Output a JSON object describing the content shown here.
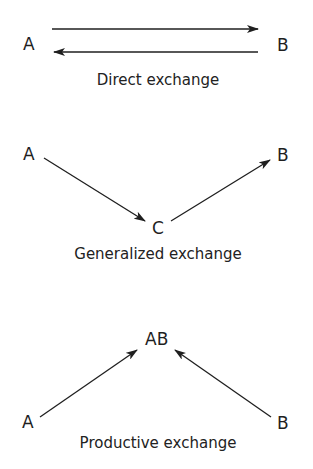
{
  "diagrams": [
    {
      "name": "direct",
      "nodes": {
        "a": "A",
        "b": "B"
      },
      "edges": [
        {
          "from": "A",
          "to": "B"
        },
        {
          "from": "B",
          "to": "A"
        }
      ],
      "caption": "Direct exchange"
    },
    {
      "name": "generalized",
      "nodes": {
        "a": "A",
        "c": "C",
        "b": "B"
      },
      "edges": [
        {
          "from": "A",
          "to": "C"
        },
        {
          "from": "C",
          "to": "B"
        }
      ],
      "caption": "Generalized exchange"
    },
    {
      "name": "productive",
      "nodes": {
        "ab": "AB",
        "a": "A",
        "b": "B"
      },
      "edges": [
        {
          "from": "A",
          "to": "AB"
        },
        {
          "from": "B",
          "to": "AB"
        }
      ],
      "caption": "Productive exchange"
    }
  ],
  "colors": {
    "ink": "#1f1f1f",
    "background": "#ffffff"
  }
}
